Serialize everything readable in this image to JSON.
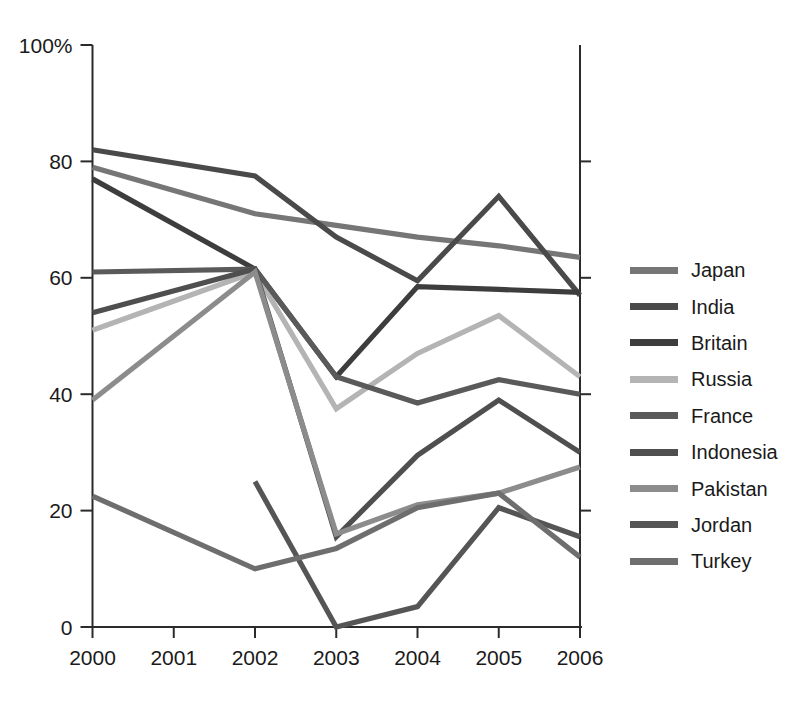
{
  "chart_data": {
    "type": "line",
    "title": "",
    "subtitle": "",
    "xlabel": "",
    "ylabel": "",
    "x": [
      "2000",
      "2001",
      "2002",
      "2003",
      "2004",
      "2005",
      "2006"
    ],
    "xlim": [
      2000,
      2006
    ],
    "ylim": [
      0,
      100
    ],
    "yticks": [
      0,
      20,
      40,
      60,
      80,
      100
    ],
    "ytick_labels": [
      "0",
      "20",
      "40",
      "60",
      "80",
      "100%"
    ],
    "xtick_labels": [
      "2000",
      "2001",
      "2002",
      "2003",
      "2004",
      "2005",
      "2006"
    ],
    "grid": false,
    "legend_position": "right",
    "series": [
      {
        "name": "Japan",
        "color": "#767676",
        "x": [
          "2000",
          "2002",
          "2003",
          "2004",
          "2005",
          "2006"
        ],
        "values": [
          79,
          71,
          69,
          67,
          65.5,
          63.5
        ]
      },
      {
        "name": "India",
        "color": "#4a4a4a",
        "x": [
          "2000",
          "2002",
          "2003",
          "2004",
          "2005",
          "2006"
        ],
        "values": [
          82,
          77.5,
          67,
          59.5,
          74,
          57
        ]
      },
      {
        "name": "Britain",
        "color": "#3d3d3d",
        "x": [
          "2000",
          "2002",
          "2003",
          "2004",
          "2005",
          "2006"
        ],
        "values": [
          77,
          61.5,
          43,
          58.5,
          58,
          57.5
        ]
      },
      {
        "name": "Russia",
        "color": "#b4b4b4",
        "x": [
          "2000",
          "2002",
          "2003",
          "2004",
          "2005",
          "2006"
        ],
        "values": [
          51,
          61,
          37.5,
          47,
          53.5,
          43
        ]
      },
      {
        "name": "France",
        "color": "#5a5a5a",
        "x": [
          "2000",
          "2002",
          "2003",
          "2004",
          "2005",
          "2006"
        ],
        "values": [
          61,
          61.5,
          43,
          38.5,
          42.5,
          40
        ]
      },
      {
        "name": "Indonesia",
        "color": "#4f4f4f",
        "x": [
          "2000",
          "2002",
          "2003",
          "2004",
          "2005",
          "2006"
        ],
        "values": [
          54,
          61.5,
          15.5,
          29.5,
          39,
          30
        ]
      },
      {
        "name": "Pakistan",
        "color": "#8c8c8c",
        "x": [
          "2000",
          "2002",
          "2003",
          "2004",
          "2005",
          "2006"
        ],
        "values": [
          39,
          61,
          16,
          21,
          23,
          27.5
        ]
      },
      {
        "name": "Jordan",
        "color": "#555555",
        "x": [
          "2002",
          "2003",
          "2004",
          "2005",
          "2006"
        ],
        "values": [
          25,
          0,
          3.5,
          20.5,
          15.5
        ]
      },
      {
        "name": "Turkey",
        "color": "#6e6e6e",
        "x": [
          "2000",
          "2002",
          "2003",
          "2004",
          "2005",
          "2006"
        ],
        "values": [
          22.5,
          10,
          13.5,
          20.5,
          23,
          12
        ]
      }
    ]
  },
  "legend": {
    "items": [
      {
        "label": "Japan",
        "color": "#767676"
      },
      {
        "label": "India",
        "color": "#4a4a4a"
      },
      {
        "label": "Britain",
        "color": "#3d3d3d"
      },
      {
        "label": "Russia",
        "color": "#b4b4b4"
      },
      {
        "label": "France",
        "color": "#5a5a5a"
      },
      {
        "label": "Indonesia",
        "color": "#4f4f4f"
      },
      {
        "label": "Pakistan",
        "color": "#8c8c8c"
      },
      {
        "label": "Jordan",
        "color": "#555555"
      },
      {
        "label": "Turkey",
        "color": "#6e6e6e"
      }
    ]
  }
}
